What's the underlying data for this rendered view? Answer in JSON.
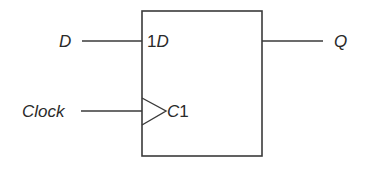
{
  "diagram": {
    "inputs": {
      "d": {
        "label": "D"
      },
      "clock": {
        "label": "Clock"
      }
    },
    "outputs": {
      "q": {
        "label": "Q"
      }
    },
    "block": {
      "pin_d": {
        "num": "1",
        "name": "D"
      },
      "pin_clk": {
        "name": "C",
        "num": "1"
      }
    },
    "colors": {
      "line": "#3a3a3a",
      "text": "#2a2a2a",
      "background": "#ffffff"
    }
  }
}
